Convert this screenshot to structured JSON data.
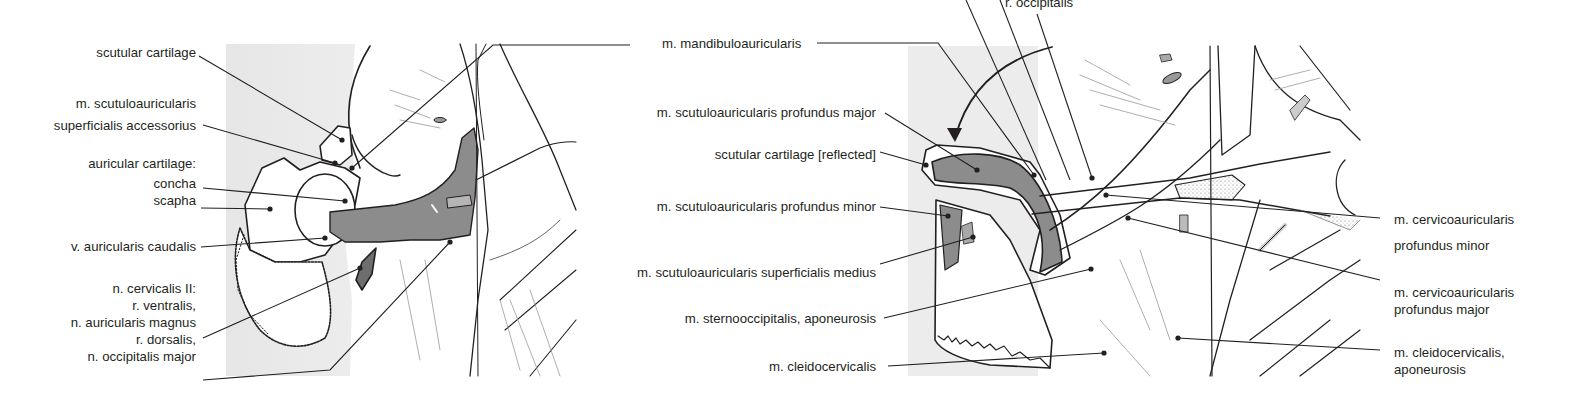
{
  "figure": {
    "type": "anatomical-illustration",
    "panels": [
      {
        "id": "left",
        "labels": [
          {
            "key": "scutular_cartilage",
            "lines": [
              "scutular cartilage"
            ]
          },
          {
            "key": "scutuloauricularis_sup_acc",
            "lines": [
              "m. scutuloauricularis",
              "superficialis accessorius"
            ]
          },
          {
            "key": "auricular_cartilage",
            "lines": [
              "auricular cartilage:",
              "concha",
              "scapha"
            ]
          },
          {
            "key": "v_auricularis_caudalis",
            "lines": [
              "v. auricularis caudalis"
            ]
          },
          {
            "key": "n_cervicalis_II",
            "lines": [
              "n. cervicalis II:",
              "r. ventralis,",
              "n. auricularis magnus",
              "r. dorsalis,",
              "n. occipitalis major"
            ]
          }
        ]
      },
      {
        "id": "right",
        "labels_left": [
          {
            "key": "mandibuloauricularis",
            "lines": [
              "m. mandibuloauricularis"
            ]
          },
          {
            "key": "scut_prof_major",
            "lines": [
              "m. scutuloauricularis profundus major"
            ]
          },
          {
            "key": "scutular_reflected",
            "lines": [
              "scutular cartilage [reflected]"
            ]
          },
          {
            "key": "scut_prof_minor",
            "lines": [
              "m. scutuloauricularis profundus minor"
            ]
          },
          {
            "key": "scut_sup_medius",
            "lines": [
              "m. scutuloauricularis superficialis medius"
            ]
          },
          {
            "key": "sternooccipitalis",
            "lines": [
              "m. sternooccipitalis, aponeurosis"
            ]
          },
          {
            "key": "cleidocervicalis",
            "lines": [
              "m. cleidocervicalis"
            ]
          }
        ],
        "labels_top": [
          {
            "key": "r_occipitalis",
            "lines": [
              "r. occipitalis"
            ]
          }
        ],
        "labels_right": [
          {
            "key": "cervicoaur_prof_minor",
            "lines": [
              "m. cervicoauricularis",
              "profundus minor"
            ]
          },
          {
            "key": "cervicoaur_prof_major",
            "lines": [
              "m. cervicoauricularis",
              "profundus major"
            ]
          },
          {
            "key": "cleidocervicalis_apo",
            "lines": [
              "m. cleidocervicalis,",
              "aponeurosis"
            ]
          }
        ]
      }
    ],
    "colors": {
      "ink": "#231f20",
      "muscle_fill": "#8c8c8c",
      "muscle_dark": "#6e6e6e",
      "background_tint": "#ececec",
      "paper": "#ffffff"
    }
  }
}
